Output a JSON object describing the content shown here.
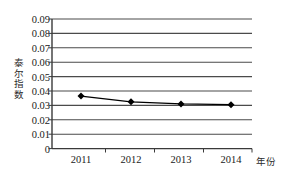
{
  "chart_data": {
    "type": "line",
    "title": "",
    "subtitle": "",
    "xlabel": "年份",
    "ylabel": "泰尔指数",
    "categories": [
      "2011",
      "2012",
      "2013",
      "2014"
    ],
    "series": [
      {
        "name": "泰尔指数",
        "values": [
          0.0365,
          0.0325,
          0.031,
          0.0305
        ],
        "color": "#000000",
        "marker": "diamond"
      }
    ],
    "ylim": [
      0,
      0.09
    ],
    "ytick_step": 0.01,
    "ytick_labels": [
      "0.09",
      "0.08",
      "0.07",
      "0.06",
      "0.05",
      "0.04",
      "0.03",
      "0.02",
      "0.01",
      "0"
    ],
    "ytick_values": [
      0.09,
      0.08,
      0.07,
      0.06,
      0.05,
      0.04,
      0.03,
      0.02,
      0.01,
      0
    ],
    "xtick_labels": [
      "2011",
      "2012",
      "2013",
      "2014"
    ],
    "grid": true,
    "grid_axis": "y",
    "legend": false,
    "legend_position": "none"
  },
  "style": {
    "background": "#ffffff",
    "grid_color": "#4a4a4a",
    "axis_color": "#3a3a3a",
    "line_color": "#000000",
    "text_color": "#1a1a1a"
  },
  "ylabel_chars": [
    "泰",
    "尔",
    "指",
    "数"
  ]
}
